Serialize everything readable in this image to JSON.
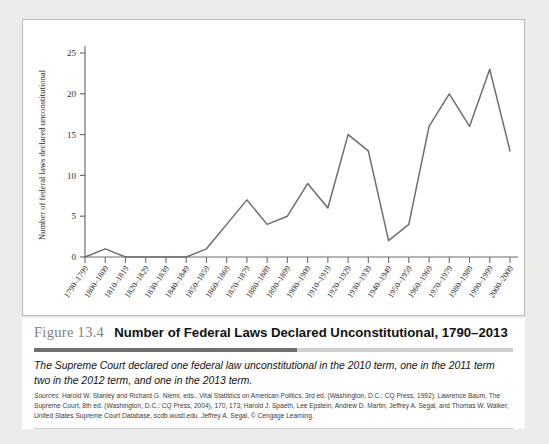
{
  "figure": {
    "number_label": "Figure 13.4",
    "title": "Number of Federal Laws Declared Unconstitutional, 1790–2013",
    "note": "The Supreme Court declared one federal law unconstitutional in the 2010 term, one in the 2011 term two in the 2012 term, and one in the 2013 term.",
    "sources_prefix": "Sources:",
    "sources": "Harold W. Stanley and Richard G. Niemi, eds., Vital Statistics on American Politics, 3rd ed. (Washington, D.C.: CQ Press, 1992); Lawrence Baum, The Supreme Court, 8th ed. (Washington, D.C.: CQ Press, 2004), 170, 173; Harold J. Spaeth, Lee Epstein, Andrew D. Martin, Jeffrey A. Segal, and Thomas W. Walker, United States Supreme Court Database, scdb.wustl.edu. Jeffrey A. Segal, © Cengage Learning."
  },
  "colors": {
    "line": "#6d6d6d",
    "axis": "#6d6d6d",
    "panel_background": "#ffffff",
    "page_background": "#ececeb",
    "rule_dark": "#6f6f6f",
    "rule_light": "#cfcfcf",
    "figure_number": "#807e7c"
  },
  "chart_data": {
    "type": "line",
    "title": "Number of Federal Laws Declared Unconstitutional, 1790–2013",
    "xlabel": "",
    "ylabel": "Number of federal laws declared unconstitutional",
    "ylim": [
      0,
      25
    ],
    "yticks": [
      0,
      5,
      10,
      15,
      20,
      25
    ],
    "grid": false,
    "legend": "none",
    "categories": [
      "1790–1799",
      "1800–1809",
      "1810–1819",
      "1820–1829",
      "1830–1839",
      "1840–1849",
      "1850–1859",
      "1860–1869",
      "1870–1879",
      "1880–1889",
      "1890–1899",
      "1900–1909",
      "1910–1919",
      "1920–1929",
      "1930–1939",
      "1940–1949",
      "1950–1959",
      "1960–1969",
      "1970–1979",
      "1980–1989",
      "1990–1999",
      "2000–2009"
    ],
    "values": [
      0,
      1,
      0,
      0,
      0,
      0,
      1,
      4,
      7,
      4,
      5,
      9,
      6,
      15,
      13,
      2,
      4,
      16,
      20,
      16,
      23,
      13
    ]
  }
}
